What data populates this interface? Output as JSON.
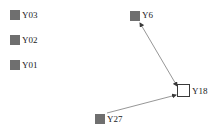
{
  "diagram": {
    "background_color": "#ffffff",
    "node_fill_color": "#6f6f6f",
    "node_hollow_fill_color": "#ffffff",
    "node_border_color": "#3a3a3a",
    "edge_color": "#8a8a8a",
    "label_color": "#1a1a1a",
    "nodes": [
      {
        "id": "Y03",
        "label": "Y03",
        "shape": "square",
        "style": "filled",
        "x": 10,
        "y": 10,
        "size": 10,
        "label_x": 22,
        "label_y": 10
      },
      {
        "id": "Y02",
        "label": "Y02",
        "shape": "square",
        "style": "filled",
        "x": 10,
        "y": 35,
        "size": 10,
        "label_x": 22,
        "label_y": 35
      },
      {
        "id": "Y01",
        "label": "Y01",
        "shape": "square",
        "style": "filled",
        "x": 10,
        "y": 60,
        "size": 10,
        "label_x": 22,
        "label_y": 60
      },
      {
        "id": "Y6",
        "label": "Y6",
        "shape": "square",
        "style": "filled",
        "x": 130,
        "y": 11,
        "size": 10,
        "label_x": 142,
        "label_y": 11
      },
      {
        "id": "Y18",
        "label": "Y18",
        "shape": "square",
        "style": "hollow",
        "x": 177,
        "y": 84,
        "size": 13,
        "label_x": 192,
        "label_y": 87
      },
      {
        "id": "Y27",
        "label": "Y27",
        "shape": "square",
        "style": "filled",
        "x": 95,
        "y": 114,
        "size": 10,
        "label_x": 107,
        "label_y": 114
      }
    ],
    "edges": [
      {
        "id": "edge-y6-y18",
        "from": "Y18",
        "to": "Y6",
        "direction": "bidirectional",
        "x1": 177,
        "y1": 86,
        "x2": 140,
        "y2": 23
      },
      {
        "id": "edge-y27-y18",
        "from": "Y27",
        "to": "Y18",
        "direction": "forward",
        "x1": 107,
        "y1": 113,
        "x2": 176,
        "y2": 95
      }
    ]
  }
}
